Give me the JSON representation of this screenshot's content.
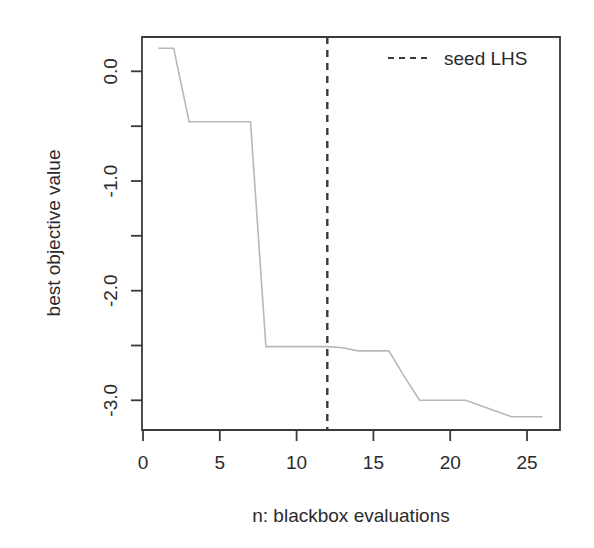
{
  "figure": {
    "width": 594,
    "height": 548,
    "background": "#ffffff",
    "line_color": "#b8b8b8",
    "axis_color": "#3a3a3a",
    "text_color": "#2b2b2b"
  },
  "chart_data": {
    "type": "line",
    "title": "",
    "subtitle": "",
    "xlabel": "n: blackbox evaluations",
    "ylabel": "best objective value",
    "xlim": [
      0,
      26.5
    ],
    "ylim": [
      -3.35,
      0.35
    ],
    "grid": false,
    "xticks": [
      0,
      5,
      10,
      15,
      20,
      25
    ],
    "xtick_labels": [
      "0",
      "5",
      "10",
      "15",
      "20",
      "25"
    ],
    "yticks": [
      0.0,
      -1.0,
      -2.0,
      -3.0
    ],
    "ytick_labels": [
      "0.0",
      "-1.0",
      "-2.0",
      "-3.0"
    ],
    "yminor_ticks": [
      -0.5,
      -1.5,
      -2.5
    ],
    "legend": {
      "position": "top-right",
      "entries": [
        {
          "label": "seed LHS",
          "style": "dashed",
          "color": "#3a3a3a"
        }
      ]
    },
    "annotations": [
      {
        "type": "vline",
        "label": "seed LHS",
        "x": 12,
        "style": "dashed",
        "color": "#3a3a3a"
      }
    ],
    "series": [
      {
        "name": "best objective value",
        "color": "#b8b8b8",
        "style": "solid",
        "x": [
          1,
          2,
          3,
          4,
          5,
          6,
          7,
          8,
          9,
          10,
          11,
          12,
          13,
          14,
          15,
          16,
          17,
          18,
          19,
          20,
          21,
          22,
          23,
          24,
          25,
          26
        ],
        "values": [
          0.21,
          0.21,
          -0.46,
          -0.46,
          -0.46,
          -0.46,
          -0.46,
          -2.51,
          -2.51,
          -2.51,
          -2.51,
          -2.51,
          -2.52,
          -2.55,
          -2.55,
          -2.55,
          -2.78,
          -3.0,
          -3.0,
          -3.0,
          -3.0,
          -3.05,
          -3.1,
          -3.15,
          -3.15,
          -3.15
        ]
      }
    ]
  }
}
